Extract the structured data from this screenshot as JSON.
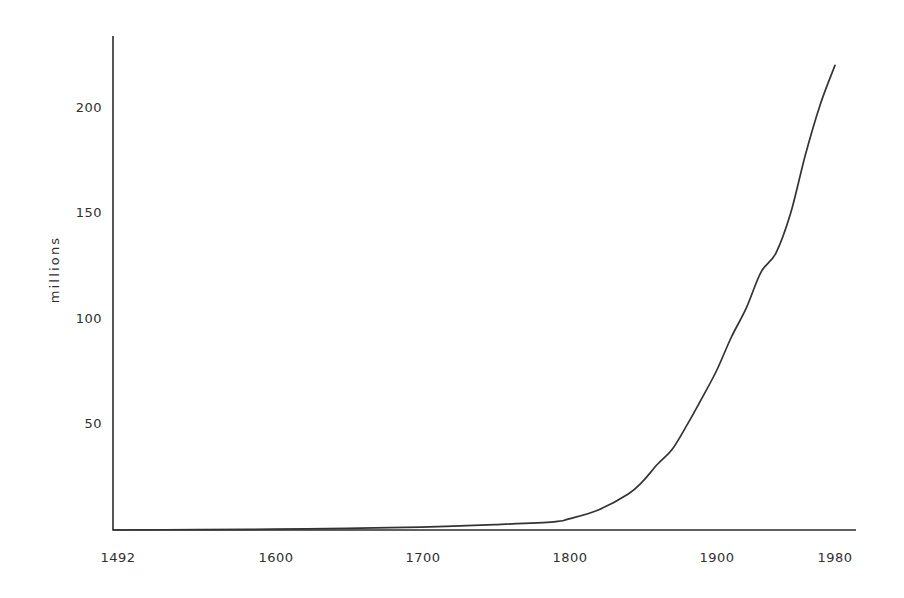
{
  "chart_data": {
    "type": "line",
    "title": "",
    "subtitle": "",
    "xlabel": "",
    "ylabel": "millions",
    "xlim": [
      1492,
      1980
    ],
    "ylim": [
      0,
      236
    ],
    "grid": false,
    "legend": null,
    "xticks": [
      1492,
      1600,
      1700,
      1800,
      1900,
      1980
    ],
    "xticklabels": [
      "1492",
      "1600",
      "1700",
      "1800",
      "1900",
      "1980"
    ],
    "yticks": [
      50,
      100,
      150,
      200
    ],
    "yticklabels": [
      "50",
      "100",
      "150",
      "200"
    ],
    "series": [
      {
        "name": "population",
        "x": [
          1492,
          1550,
          1600,
          1650,
          1700,
          1750,
          1790,
          1800,
          1820,
          1840,
          1850,
          1860,
          1870,
          1880,
          1890,
          1900,
          1910,
          1920,
          1930,
          1940,
          1950,
          1960,
          1970,
          1980
        ],
        "values": [
          0.0,
          0.2,
          0.4,
          0.8,
          1.4,
          2.6,
          3.9,
          5.3,
          9.6,
          17.1,
          23.2,
          31.4,
          38.6,
          50.2,
          62.9,
          76.2,
          92.2,
          106.0,
          123.2,
          132.2,
          151.3,
          179.3,
          203.2,
          222.0
        ]
      }
    ]
  },
  "axes": {
    "y_title": "millions",
    "y_tick_0": "200",
    "y_tick_1": "150",
    "y_tick_2": "100",
    "y_tick_3": "50",
    "x_tick_0": "1492",
    "x_tick_1": "1600",
    "x_tick_2": "1700",
    "x_tick_3": "1800",
    "x_tick_4": "1900",
    "x_tick_5": "1980"
  },
  "style": {
    "background": "#ffffff",
    "axis_color": "#2b2b2b",
    "line_color": "#333333",
    "text_color": "#2f2f2f"
  }
}
